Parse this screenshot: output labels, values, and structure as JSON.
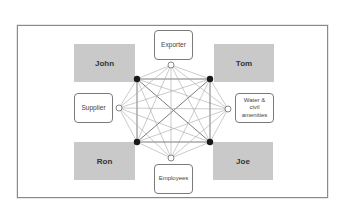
{
  "diagram": {
    "type": "network",
    "persons": [
      {
        "id": "john",
        "label": "John",
        "node": [
          137,
          79
        ]
      },
      {
        "id": "tom",
        "label": "Tom",
        "node": [
          210,
          79
        ]
      },
      {
        "id": "ron",
        "label": "Ron",
        "node": [
          137,
          142
        ]
      },
      {
        "id": "joe",
        "label": "Joe",
        "node": [
          210,
          142
        ]
      }
    ],
    "roles": [
      {
        "id": "exporter",
        "label": "Exporter",
        "node": [
          171,
          65
        ]
      },
      {
        "id": "supplier",
        "label": "Supplier",
        "node": [
          119,
          108
        ]
      },
      {
        "id": "water",
        "label": "Water & civil amenities",
        "node": [
          228,
          109
        ]
      },
      {
        "id": "employees",
        "label": "Employees",
        "node": [
          171,
          158
        ]
      }
    ],
    "edges": "all pairs connected (complete graph K8)",
    "colors": {
      "person_fill": "#c9c9c9",
      "person_node": "#1a1a1a",
      "strong_edge": "#6e6e6e",
      "weak_edge": "#a8a8a8"
    }
  }
}
